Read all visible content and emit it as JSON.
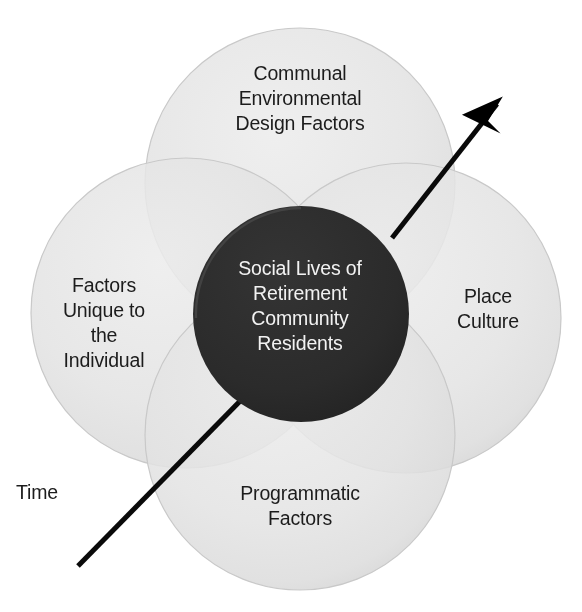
{
  "diagram": {
    "type": "venn-four-circle-with-core",
    "title_text_present": false,
    "colors": {
      "background": "#ffffff",
      "circle_fill": "#e0e0e0",
      "circle_overlap": "#cfcfcf",
      "core_fill": "#2b2b2b",
      "core_text": "#f2f2f2",
      "label_text": "#1c1c1c",
      "arrow": "#000000"
    },
    "circles": [
      {
        "id": "communal-environmental-design-factors",
        "position": "top",
        "label": "Communal\nEnvironmental\nDesign Factors",
        "cx": 300,
        "cy": 183,
        "r": 155
      },
      {
        "id": "factors-unique-to-the-individual",
        "position": "left",
        "label": "Factors\nUnique to\nthe\nIndividual",
        "cx": 186,
        "cy": 313,
        "r": 155
      },
      {
        "id": "place-culture",
        "position": "right",
        "label": "Place\nCulture",
        "cx": 406,
        "cy": 318,
        "r": 155
      },
      {
        "id": "programmatic-factors",
        "position": "bottom",
        "label": "Programmatic\nFactors",
        "cx": 300,
        "cy": 435,
        "r": 155
      }
    ],
    "core": {
      "id": "social-lives-of-retirement-community-residents",
      "label": "Social Lives of\nRetirement\nCommunity\nResidents",
      "cx": 301,
      "cy": 314,
      "r": 108
    },
    "arrow": {
      "label": "Time",
      "label_x": 16,
      "label_y": 480,
      "tail_x": 78,
      "tail_y": 566,
      "tip_x": 503,
      "tip_y": 98,
      "stroke_width": 5
    }
  }
}
